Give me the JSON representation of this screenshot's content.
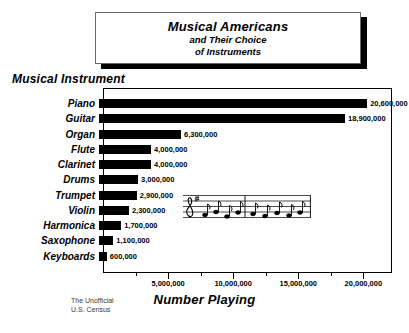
{
  "title": {
    "line1": "Musical Americans",
    "line2": "and Their Choice",
    "line3": "of Instruments"
  },
  "axes": {
    "y_title": "Musical Instrument",
    "x_title": "Number Playing"
  },
  "source_note": {
    "line1": "The Unofficial",
    "line2": "U.S. Census"
  },
  "decoration": {
    "staff_icon": "music-staff-eighth-notes",
    "clef": "treble-clef"
  },
  "chart_data": {
    "type": "bar",
    "orientation": "horizontal",
    "title": "Musical Americans and Their Choice of Instruments",
    "xlabel": "Number Playing",
    "ylabel": "Musical Instrument",
    "xlim": [
      0,
      22200000
    ],
    "grid": false,
    "legend": false,
    "tick_values": [
      5000000,
      10000000,
      15000000,
      20000000
    ],
    "tick_labels": [
      "5,000,000",
      "10,000,000",
      "15,000,000",
      "20,000,000"
    ],
    "minor_tick_values": [
      2500000,
      7500000,
      12500000,
      17500000
    ],
    "categories": [
      "Piano",
      "Guitar",
      "Organ",
      "Flute",
      "Clarinet",
      "Drums",
      "Trumpet",
      "Violin",
      "Harmonica",
      "Saxophone",
      "Keyboards"
    ],
    "values": [
      20600000,
      18900000,
      6300000,
      4000000,
      4000000,
      3000000,
      2900000,
      2300000,
      1700000,
      1100000,
      600000
    ],
    "value_labels": [
      "20,600,000",
      "18,900,000",
      "6,300,000",
      "4,000,000",
      "4,000,000",
      "3,000,000",
      "2,900,000",
      "2,300,000",
      "1,700,000",
      "1,100,000",
      "600,000"
    ],
    "bar_color": "#000000"
  }
}
